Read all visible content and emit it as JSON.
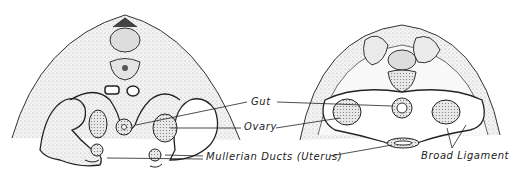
{
  "figure": {
    "left_panel": {
      "name": "early-stage cross section"
    },
    "right_panel": {
      "name": "later-stage cross section"
    },
    "labels": {
      "gut": "Gut",
      "ovary": "Ovary",
      "mullerian": "Mullerian Ducts (Uterus)",
      "broad_ligament": "Broad Ligament"
    }
  }
}
